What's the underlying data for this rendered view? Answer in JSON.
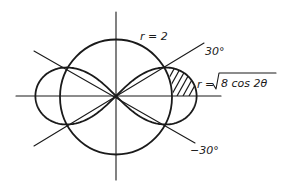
{
  "diagram": {
    "type": "polar-region",
    "colors": {
      "ink": "#1a1a1a",
      "background": "#ffffff"
    },
    "labels": {
      "circle": "r = 2",
      "angle_pos": "30°",
      "angle_neg": "−30°",
      "lemniscate_lhs": "r =",
      "lemniscate_radicand": "8 cos 2θ"
    },
    "curves": [
      {
        "name": "circle",
        "equation": "r = 2",
        "radius": 2
      },
      {
        "name": "lemniscate",
        "equation": "r = sqrt(8 cos 2θ)",
        "a_squared": 8
      }
    ],
    "rays_deg": [
      30,
      -30
    ],
    "shaded_region": {
      "inside": "lemniscate",
      "outside": "circle",
      "theta_from_deg": 0,
      "theta_to_deg": 30
    },
    "geometry": {
      "cx": 116,
      "cy": 96,
      "scale": 28.5
    }
  }
}
